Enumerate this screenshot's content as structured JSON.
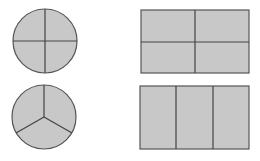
{
  "colors": {
    "fill": "#c8c8c8",
    "stroke": "#555555",
    "background": "#ffffff"
  },
  "shapes": [
    {
      "id": "circle-quarters",
      "type": "circle",
      "parts": 4,
      "cx": 45,
      "cy": 41,
      "r": 32
    },
    {
      "id": "rect-quarters",
      "type": "rectangle",
      "parts": 4,
      "x": 141,
      "y": 10,
      "w": 108,
      "h": 63
    },
    {
      "id": "circle-thirds",
      "type": "circle",
      "parts": 3,
      "cx": 44,
      "cy": 117,
      "r": 32
    },
    {
      "id": "rect-thirds",
      "type": "rectangle",
      "parts": 3,
      "x": 140,
      "y": 86,
      "w": 109,
      "h": 63
    }
  ]
}
